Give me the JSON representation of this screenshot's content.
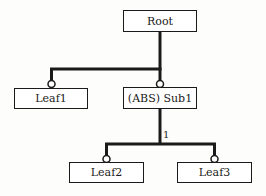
{
  "diagram": {
    "type": "feature-tree",
    "nodes": {
      "root": {
        "label": "Root"
      },
      "leaf1": {
        "label": "Leaf1"
      },
      "sub1": {
        "label": "(ABS) Sub1"
      },
      "leaf2": {
        "label": "Leaf2"
      },
      "leaf3": {
        "label": "Leaf3"
      }
    },
    "edges": [
      {
        "from": "root",
        "to": "leaf1",
        "connector": "optional-circle"
      },
      {
        "from": "root",
        "to": "sub1",
        "connector": "optional-circle"
      },
      {
        "from": "sub1",
        "to": "leaf2",
        "connector": "optional-circle",
        "group": "g1"
      },
      {
        "from": "sub1",
        "to": "leaf3",
        "connector": "optional-circle",
        "group": "g1"
      }
    ],
    "group_labels": {
      "g1": "1"
    },
    "colors": {
      "line": "#1a1a1a",
      "box_fill": "#ffffff",
      "background": "#fdfdfb"
    }
  }
}
